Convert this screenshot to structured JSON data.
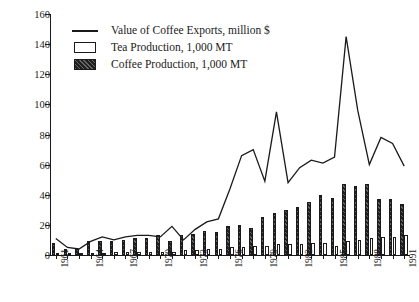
{
  "chart_data": {
    "type": "bar",
    "title": "",
    "xlabel": "",
    "ylabel": "",
    "ylim": [
      0,
      160
    ],
    "ytick_step": 20,
    "yticks": [
      0,
      20,
      40,
      60,
      80,
      100,
      120,
      140,
      160
    ],
    "grid": false,
    "legend_position": "top-left",
    "categories": [
      "1961",
      "1962",
      "1963",
      "1964",
      "1965",
      "1966",
      "1967",
      "1968",
      "1969",
      "1970",
      "1971",
      "1972",
      "1973",
      "1974",
      "1975",
      "1976",
      "1977",
      "1978",
      "1979",
      "1980",
      "1981",
      "1982",
      "1983",
      "1984",
      "1985",
      "1986",
      "1987",
      "1988",
      "1989",
      "1990",
      "1991"
    ],
    "xtick_labels_shown": [
      "1961",
      "1964",
      "1967",
      "1970",
      "1973",
      "1976",
      "1979",
      "1982",
      "1985",
      "1988",
      "1991"
    ],
    "series": [
      {
        "name": "Value of Coffee Exports, million $",
        "type": "line",
        "unit": "million $",
        "values": [
          11,
          5,
          4,
          9,
          12,
          10,
          12,
          13,
          13,
          12,
          19,
          10,
          17,
          22,
          24,
          44,
          66,
          70,
          49,
          95,
          48,
          58,
          63,
          61,
          65,
          145,
          96,
          60,
          78,
          74,
          59
        ]
      },
      {
        "name": "Coffee Production, 1,000 MT",
        "type": "bar",
        "unit": "1,000 MT",
        "values": [
          8,
          4,
          4,
          9,
          9,
          9,
          10,
          11,
          11,
          13,
          9,
          13,
          14,
          16,
          15,
          19,
          20,
          18,
          25,
          28,
          30,
          32,
          35,
          40,
          38,
          47,
          46,
          47,
          37,
          37,
          34
        ]
      },
      {
        "name": "Tea Production, 1,000 MT",
        "type": "bar",
        "unit": "1,000 MT",
        "values": [
          1,
          1,
          1,
          1,
          1,
          2,
          2,
          2,
          2,
          2,
          2,
          3,
          3,
          4,
          4,
          5,
          5,
          6,
          6,
          7,
          7,
          7,
          8,
          8,
          6,
          9,
          10,
          11,
          12,
          12,
          13
        ]
      }
    ]
  },
  "legend": {
    "items": [
      {
        "label": "Value of Coffee Exports, million $",
        "key": "line-key",
        "color": "#1a1a1a"
      },
      {
        "label": "Tea Production, 1,000 MT",
        "key": "open-box-key",
        "color": "#ffffff"
      },
      {
        "label": "Coffee Production, 1,000 MT",
        "key": "hatched-box-key",
        "color": "#1f1f1f"
      }
    ]
  }
}
